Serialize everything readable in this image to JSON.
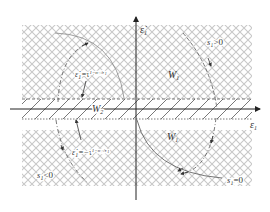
{
  "diagram": {
    "type": "phase-plane sliding-mode diagram",
    "colors": {
      "crosshatch": "#c8c8c8",
      "band_hatch": "#555555",
      "axis": "#222222",
      "curve": "#666666",
      "text": "#333333",
      "background": "#ffffff"
    },
    "axes": {
      "x_label": "ε",
      "x_label_sub": "1",
      "y_label": "ε̇",
      "y_label_sub": "1"
    },
    "regions": {
      "upper": {
        "label": "W",
        "sub": "1"
      },
      "lower": {
        "label": "W",
        "sub": "1"
      },
      "band": {
        "label": "W",
        "sub": "2"
      }
    },
    "equations": {
      "upper": {
        "lhs": "ε̇",
        "lhs_sub": "1",
        "rhs": "=τ",
        "exponent": "1−m",
        "exp_sub1": "1",
        "exp_mid": "/n",
        "exp_sub2": "1"
      },
      "lower": {
        "lhs": "ε̇",
        "lhs_sub": "1",
        "rhs": "=−τ",
        "exponent": "1−m",
        "exp_sub1": "1",
        "exp_mid": "/n",
        "exp_sub2": "1"
      }
    },
    "curve_labels": {
      "positive": {
        "s": "s",
        "sub": "1",
        "rel": ">0"
      },
      "negative": {
        "s": "s",
        "sub": "1",
        "rel": "<0"
      },
      "zero": {
        "s": "s",
        "sub": "1",
        "rel": "=0"
      }
    }
  }
}
